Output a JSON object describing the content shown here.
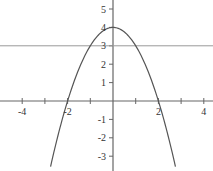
{
  "chart_data": {
    "type": "line",
    "title": "",
    "xlabel": "",
    "ylabel": "",
    "xlim": [
      -5,
      4.4
    ],
    "ylim": [
      -3.6,
      5.5
    ],
    "grid": false,
    "legend": null,
    "x_ticks": [
      -4,
      -3,
      -2,
      -1,
      1,
      2,
      3,
      4
    ],
    "x_tick_labels": [
      "-4",
      "-2",
      "2",
      "4"
    ],
    "y_ticks": [
      -3,
      -2,
      -1,
      1,
      2,
      3,
      4,
      5
    ],
    "y_tick_labels": [
      "-3",
      "-2",
      "-1",
      "1",
      "2",
      "3",
      "4",
      "5"
    ],
    "series": [
      {
        "name": "y = 4 - x^2",
        "kind": "curve",
        "x": [
          -2.75,
          -2.5,
          -2,
          -1.5,
          -1,
          -0.5,
          0,
          0.5,
          1,
          1.5,
          2,
          2.5,
          2.75
        ],
        "y": [
          -3.5625,
          -2.25,
          0,
          1.75,
          3,
          3.75,
          4,
          3.75,
          3,
          1.75,
          0,
          -2.25,
          -3.5625
        ],
        "color": "#555555"
      },
      {
        "name": "y = 3",
        "kind": "horizontal-line",
        "y_value": 3,
        "color": "#999999"
      }
    ]
  },
  "axes": {
    "x_labels": [
      {
        "value": -4,
        "text": "-4"
      },
      {
        "value": -2,
        "text": "-2"
      },
      {
        "value": 2,
        "text": "2"
      },
      {
        "value": 4,
        "text": "4"
      }
    ],
    "y_labels": [
      {
        "value": 5,
        "text": "5"
      },
      {
        "value": 4,
        "text": "4"
      },
      {
        "value": 3,
        "text": "3"
      },
      {
        "value": 2,
        "text": "2"
      },
      {
        "value": 1,
        "text": "1"
      },
      {
        "value": -1,
        "text": "-1"
      },
      {
        "value": -2,
        "text": "-2"
      },
      {
        "value": -3,
        "text": "-3"
      }
    ]
  }
}
